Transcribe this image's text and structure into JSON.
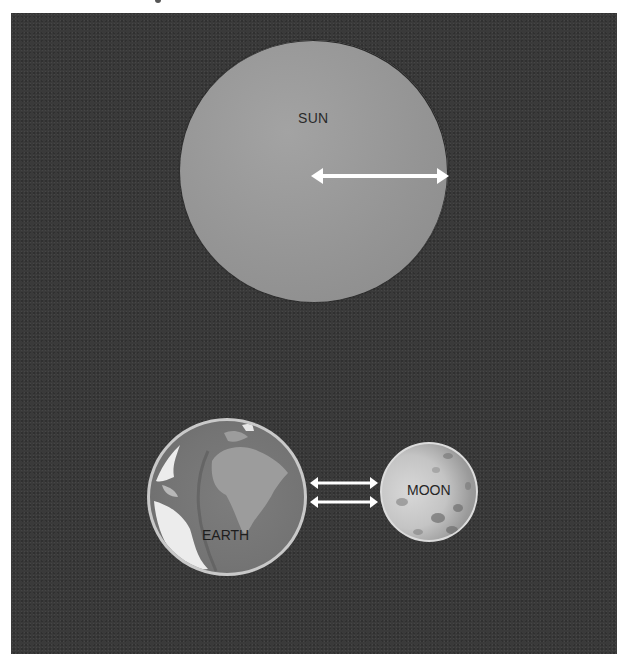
{
  "diagram": {
    "type": "scale comparison illustration",
    "bodies": [
      {
        "id": "sun",
        "label": "SUN",
        "color": "#959595"
      },
      {
        "id": "earth",
        "label": "EARTH",
        "color": "#747474"
      },
      {
        "id": "moon",
        "label": "MOON",
        "color": "#c4c4c4"
      }
    ],
    "arrows": [
      {
        "id": "sun-radius-arrow",
        "from": "sun-center",
        "to": "sun-edge",
        "style": "double-headed",
        "color": "#ffffff"
      },
      {
        "id": "earth-moon-arrow-1",
        "from": "earth",
        "to": "moon",
        "style": "double-headed",
        "color": "#ffffff"
      },
      {
        "id": "earth-moon-arrow-2",
        "from": "earth",
        "to": "moon",
        "style": "double-headed",
        "color": "#ffffff"
      }
    ],
    "background_color": "#3a3a3a"
  }
}
